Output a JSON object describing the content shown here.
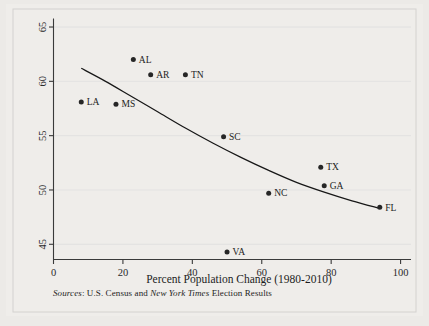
{
  "chart_data": {
    "type": "scatter",
    "title": "",
    "xlabel": "Percent Population Change (1980-2010)",
    "ylabel": "",
    "xlim": [
      0,
      103
    ],
    "ylim": [
      43.6,
      65.6
    ],
    "xticks": [
      "0",
      "20",
      "40",
      "60",
      "80",
      "100"
    ],
    "xtick_values": [
      0,
      20,
      40,
      60,
      80,
      100
    ],
    "yticks": [
      "45",
      "50",
      "55",
      "60",
      "65"
    ],
    "ytick_values": [
      45,
      50,
      55,
      60,
      65
    ],
    "grid": true,
    "legend": "none",
    "ylabel_rotated": true,
    "points": [
      {
        "label": "LA",
        "x": 8,
        "y": 58.1
      },
      {
        "label": "MS",
        "x": 18,
        "y": 57.9
      },
      {
        "label": "AL",
        "x": 23,
        "y": 62.0
      },
      {
        "label": "AR",
        "x": 28,
        "y": 60.6
      },
      {
        "label": "TN",
        "x": 38,
        "y": 60.6
      },
      {
        "label": "SC",
        "x": 49,
        "y": 54.9
      },
      {
        "label": "VA",
        "x": 50,
        "y": 44.3
      },
      {
        "label": "NC",
        "x": 62,
        "y": 49.7
      },
      {
        "label": "TX",
        "x": 77,
        "y": 52.1
      },
      {
        "label": "GA",
        "x": 78,
        "y": 50.4
      },
      {
        "label": "FL",
        "x": 94,
        "y": 48.4
      }
    ],
    "fit_curve": {
      "description": "downward-sloping fitted trend line",
      "x": [
        8,
        15,
        22,
        30,
        38,
        46,
        54,
        62,
        70,
        78,
        86,
        94
      ],
      "y": [
        61.2,
        60.0,
        58.7,
        57.2,
        55.7,
        54.3,
        53.0,
        51.8,
        50.7,
        49.8,
        49.0,
        48.3
      ]
    },
    "source_note": {
      "prefix_italic": "Sources",
      "prefix_rest": ": U.S. Census and ",
      "publication_italic": "New York Times",
      "suffix": " Election Results"
    },
    "colors": {
      "marker": "#262626",
      "curve": "#171717",
      "axis": "#3a3a3a",
      "grid": "#dedede",
      "background": "#efedea",
      "text": "#1d1d1d"
    }
  }
}
